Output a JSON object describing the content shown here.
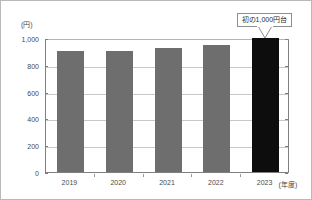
{
  "chart_data": {
    "type": "bar",
    "title": "",
    "subtitle": "",
    "xlabel": "(年度)",
    "ylabel": "(円)",
    "categories": [
      "2019",
      "2020",
      "2021",
      "2022",
      "2023"
    ],
    "values": [
      900,
      900,
      925,
      950,
      1000
    ],
    "ylim": [
      0,
      1000
    ],
    "yticks": [
      0,
      200,
      400,
      600,
      800,
      1000
    ],
    "ytick_labels": [
      "0",
      "200",
      "400",
      "600",
      "800",
      "1,000"
    ],
    "grid": true,
    "legend": null,
    "bar_color": "#6e6e6e",
    "highlight_color": "#0d0d0d",
    "highlight_index": 4,
    "annotations": [
      {
        "text": "初の1,000円台",
        "target_category": "2023",
        "style": "callout-box-with-pointer"
      }
    ]
  },
  "figure": {
    "unit_label": "(円)",
    "x_axis_unit": "(年度)",
    "border_color": "#b9b9b9",
    "gridline_color": "#c8c8c8",
    "axis_color": "#808080",
    "text_color": "#4a4a4a"
  },
  "callout": {
    "text": "初の1,000円台"
  }
}
